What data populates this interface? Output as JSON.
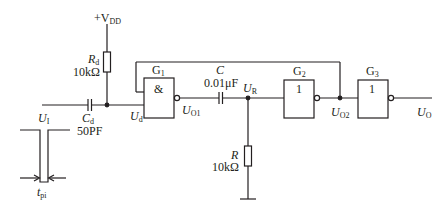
{
  "diagram": {
    "type": "circuit-schematic",
    "supply": {
      "label": "+V",
      "sub": "DD"
    },
    "components": {
      "Rd": {
        "symbol": "R",
        "sub": "d",
        "value": "10kΩ"
      },
      "Cd": {
        "symbol": "C",
        "sub": "d",
        "value": "50PF"
      },
      "C": {
        "symbol": "C",
        "value": "0.01μF"
      },
      "R": {
        "symbol": "R",
        "value": "10kΩ"
      }
    },
    "gates": [
      {
        "id": "G1",
        "name": "G",
        "sub": "1",
        "function": "&"
      },
      {
        "id": "G2",
        "name": "G",
        "sub": "2",
        "function": "1"
      },
      {
        "id": "G3",
        "name": "G",
        "sub": "3",
        "function": "1"
      }
    ],
    "nodes": {
      "UI": {
        "symbol": "U",
        "sub": "I"
      },
      "Ud": {
        "symbol": "U",
        "sub": "d"
      },
      "UO1": {
        "symbol": "U",
        "sub": "O1"
      },
      "UR": {
        "symbol": "U",
        "sub": "R"
      },
      "UO2": {
        "symbol": "U",
        "sub": "O2"
      },
      "UO": {
        "symbol": "U",
        "sub": "O"
      }
    },
    "pulse": {
      "width_label": "t",
      "width_sub": "pi"
    },
    "colors": {
      "line": "#231f20",
      "background": "#ffffff"
    }
  }
}
